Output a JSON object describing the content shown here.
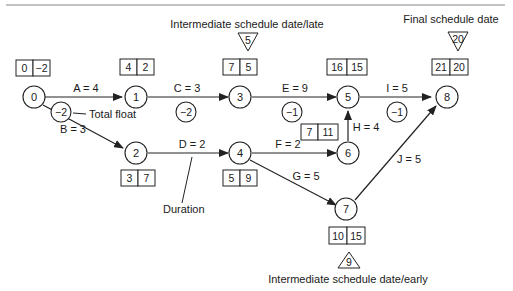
{
  "nodes": [
    {
      "id": "0",
      "label": "0",
      "early": "0",
      "late": "−2"
    },
    {
      "id": "1",
      "label": "1",
      "early": "4",
      "late": "2"
    },
    {
      "id": "2",
      "label": "2",
      "early": "3",
      "late": "7"
    },
    {
      "id": "3",
      "label": "3",
      "early": "7",
      "late": "5"
    },
    {
      "id": "4",
      "label": "4",
      "early": "5",
      "late": "9"
    },
    {
      "id": "5",
      "label": "5",
      "early": "16",
      "late": "15"
    },
    {
      "id": "6",
      "label": "6",
      "early": "7",
      "late": "11"
    },
    {
      "id": "7",
      "label": "7",
      "early": "10",
      "late": "15"
    },
    {
      "id": "8",
      "label": "8",
      "early": "21",
      "late": "20"
    }
  ],
  "activities": [
    {
      "label": "A = 4",
      "from": "0",
      "to": "1",
      "float": "−2"
    },
    {
      "label": "B = 3",
      "from": "0",
      "to": "2"
    },
    {
      "label": "C = 3",
      "from": "1",
      "to": "3",
      "float": "−2"
    },
    {
      "label": "D = 2",
      "from": "2",
      "to": "4"
    },
    {
      "label": "E = 9",
      "from": "3",
      "to": "5",
      "float": "−1"
    },
    {
      "label": "F = 2",
      "from": "4",
      "to": "6"
    },
    {
      "label": "G = 5",
      "from": "4",
      "to": "7"
    },
    {
      "label": "H = 4",
      "from": "6",
      "to": "5"
    },
    {
      "label": "I = 5",
      "from": "5",
      "to": "8",
      "float": "−1"
    },
    {
      "label": "J = 5",
      "from": "7",
      "to": "8"
    }
  ],
  "annotations": {
    "total_float": "Total float",
    "duration": "Duration",
    "intermediate_late": "Intermediate schedule date/late",
    "intermediate_late_value": "5",
    "final": "Final schedule date",
    "final_value": "20",
    "intermediate_early": "Intermediate schedule date/early",
    "intermediate_early_value": "9"
  }
}
